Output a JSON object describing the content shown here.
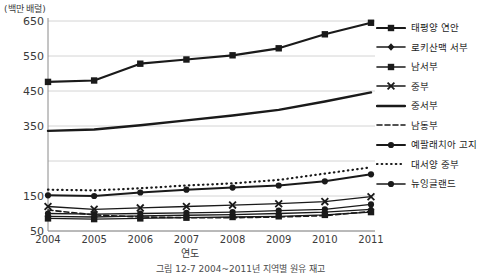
{
  "chart_data": {
    "type": "line",
    "title": "",
    "unit_label": "(백만 배럴)",
    "xlabel": "연도",
    "ylabel": "",
    "caption": "그림 12-7 2004~2011년 지역별 원유 재고",
    "categories": [
      "2004",
      "2005",
      "2006",
      "2007",
      "2008",
      "2009",
      "2010",
      "2011"
    ],
    "ylim": [
      50,
      650
    ],
    "yticks": [
      "650",
      "550",
      "450",
      "350",
      "250",
      "150",
      "50"
    ],
    "ytick_values": [
      650,
      550,
      450,
      350,
      250,
      150,
      50
    ],
    "ytick_hidden": [
      "250"
    ],
    "grid": true,
    "legend_position": "right",
    "series": [
      {
        "name": "태평양 연안",
        "marker": "square",
        "line": "solid",
        "width": 2.2,
        "values": [
          476,
          480,
          528,
          540,
          552,
          572,
          612,
          645
        ]
      },
      {
        "name": "로키산맥 서부",
        "marker": "diamond",
        "line": "solid",
        "width": 1.3,
        "values": [
          92,
          90,
          93,
          95,
          97,
          100,
          104,
          112
        ]
      },
      {
        "name": "남서부",
        "marker": "square",
        "line": "solid",
        "width": 1.3,
        "values": [
          86,
          84,
          86,
          88,
          90,
          92,
          96,
          104
        ]
      },
      {
        "name": "중부",
        "marker": "x",
        "line": "solid",
        "width": 1.3,
        "values": [
          120,
          112,
          116,
          120,
          124,
          128,
          134,
          148
        ]
      },
      {
        "name": "중서부",
        "marker": "none",
        "line": "solid",
        "width": 2.4,
        "values": [
          336,
          340,
          352,
          366,
          380,
          396,
          420,
          446
        ]
      },
      {
        "name": "남동부",
        "marker": "none",
        "line": "dashed",
        "width": 1.6,
        "values": [
          110,
          96,
          90,
          88,
          88,
          90,
          94,
          106
        ]
      },
      {
        "name": "예팔래치아 고지",
        "marker": "circle",
        "line": "solid",
        "width": 2.0,
        "values": [
          152,
          150,
          160,
          168,
          174,
          180,
          192,
          212
        ]
      },
      {
        "name": "대서양 중부",
        "marker": "none",
        "line": "dotted",
        "width": 2.2,
        "values": [
          168,
          166,
          172,
          180,
          186,
          196,
          214,
          232
        ]
      },
      {
        "name": "뉴잉글랜드",
        "marker": "circle",
        "line": "solid",
        "width": 1.3,
        "values": [
          100,
          98,
          100,
          102,
          104,
          108,
          112,
          126
        ]
      }
    ]
  }
}
